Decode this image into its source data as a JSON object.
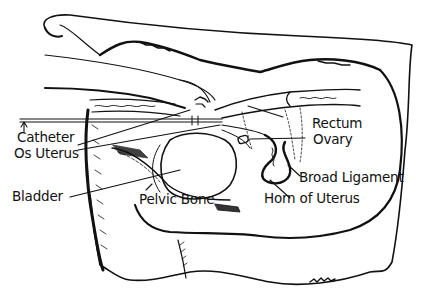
{
  "figure": {
    "labels": {
      "catheter": "Catheter",
      "os_uterus": "Os Uterus",
      "bladder": "Bladder",
      "pelvic_bone": "Pelvic Bone",
      "rectum": "Rectum",
      "ovary": "Ovary",
      "broad_ligament": "Broad Ligament",
      "horn_of_uterus": "Horn of Uterus"
    },
    "colors": {
      "ink": "#111111",
      "background": "#ffffff"
    }
  }
}
